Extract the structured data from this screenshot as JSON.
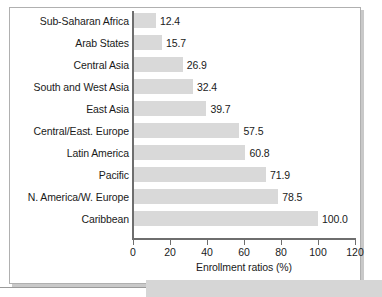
{
  "figure": {
    "frame_border_color": "#b0b0b0",
    "shadow_color": "#c9c9c9",
    "background": "#ffffff"
  },
  "chart_data": {
    "type": "bar",
    "orientation": "horizontal",
    "title": "",
    "xlabel": "Enrollment ratios (%)",
    "ylabel": "",
    "categories": [
      "Sub-Saharan Africa",
      "Arab States",
      "Central Asia",
      "South and West Asia",
      "East Asia",
      "Central/East. Europe",
      "Latin America",
      "Pacific",
      "N. America/W. Europe",
      "Caribbean"
    ],
    "values": [
      12.4,
      15.7,
      26.9,
      32.4,
      39.7,
      57.5,
      60.8,
      71.9,
      78.5,
      100.0
    ],
    "value_labels": [
      "12.4",
      "15.7",
      "26.9",
      "32.4",
      "39.7",
      "57.5",
      "60.8",
      "71.9",
      "78.5",
      "100.0"
    ],
    "xlim": [
      0,
      120
    ],
    "xticks": [
      0,
      20,
      40,
      60,
      80,
      100,
      120
    ],
    "xtick_labels": [
      "0",
      "20",
      "40",
      "60",
      "80",
      "100",
      "120"
    ],
    "grid": false,
    "legend": null,
    "bar_color": "#d9d9d9",
    "axis_color": "#6e6e6e",
    "text_color": "#1a1a1a"
  }
}
